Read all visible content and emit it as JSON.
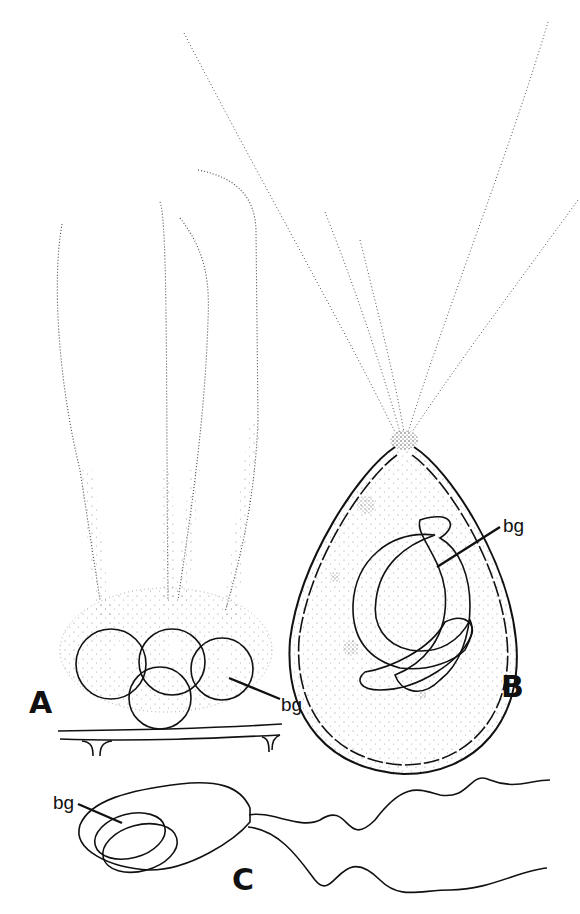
{
  "figure": {
    "panels": [
      {
        "id": "A",
        "label": "A",
        "annotation": "bg",
        "description": "cluster of four spherical cells with long dotted hairs, on substrate filament"
      },
      {
        "id": "B",
        "label": "B",
        "annotation": "bg",
        "description": "ovoid cell with segmented wall, apical tuft of hairs, curved band inside"
      },
      {
        "id": "C",
        "label": "C",
        "annotation": "bg",
        "description": "biflagellate cell with two oval inclusions"
      }
    ],
    "colors": {
      "ink": "#111111",
      "paper": "#ffffff",
      "stipple": "#555555"
    }
  }
}
